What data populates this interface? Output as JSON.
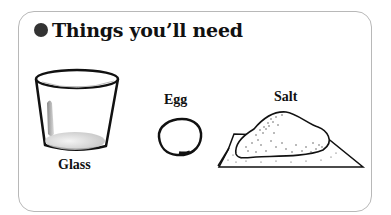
{
  "card": {
    "title": "Things you’ll need",
    "bullet_color": "#333333",
    "border_color": "#b8b8b8"
  },
  "items": [
    {
      "name": "Glass",
      "icon": "glass-icon"
    },
    {
      "name": "Egg",
      "icon": "egg-icon"
    },
    {
      "name": "Salt",
      "icon": "salt-pile-icon"
    }
  ]
}
